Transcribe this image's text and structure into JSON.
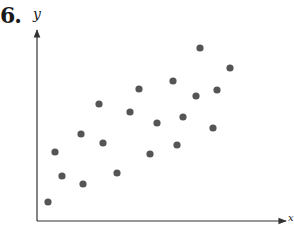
{
  "problem": {
    "number": "6."
  },
  "axes": {
    "x_label": "x",
    "y_label": "y"
  },
  "colors": {
    "dot": "#555555",
    "axis": "#333333"
  },
  "chart_data": {
    "type": "scatter",
    "title": "",
    "xlabel": "x",
    "ylabel": "y",
    "grid": false,
    "tick_labels": false,
    "note": "Unlabeled scatter plot showing positive correlation; values are pixel-estimated positions normalized to 0-100 scale along each axis.",
    "points": [
      {
        "x": 4.4,
        "y": 10.1
      },
      {
        "x": 7.3,
        "y": 36.5
      },
      {
        "x": 10.1,
        "y": 23.8
      },
      {
        "x": 17.7,
        "y": 46.0
      },
      {
        "x": 18.5,
        "y": 19.6
      },
      {
        "x": 25.0,
        "y": 61.9
      },
      {
        "x": 26.6,
        "y": 41.3
      },
      {
        "x": 32.3,
        "y": 25.4
      },
      {
        "x": 37.5,
        "y": 57.1
      },
      {
        "x": 41.1,
        "y": 69.8
      },
      {
        "x": 45.6,
        "y": 34.9
      },
      {
        "x": 48.4,
        "y": 51.3
      },
      {
        "x": 54.8,
        "y": 74.1
      },
      {
        "x": 56.5,
        "y": 40.2
      },
      {
        "x": 58.9,
        "y": 54.5
      },
      {
        "x": 64.1,
        "y": 66.1
      },
      {
        "x": 65.7,
        "y": 91.5
      },
      {
        "x": 71.0,
        "y": 49.2
      },
      {
        "x": 72.6,
        "y": 69.3
      },
      {
        "x": 77.8,
        "y": 80.4
      }
    ],
    "pixel_points": [
      [
        48,
        202
      ],
      [
        55,
        152
      ],
      [
        62,
        176
      ],
      [
        81,
        134
      ],
      [
        83,
        184
      ],
      [
        99,
        104
      ],
      [
        103,
        143
      ],
      [
        117,
        173
      ],
      [
        130,
        112
      ],
      [
        139,
        89
      ],
      [
        150,
        154
      ],
      [
        157,
        123
      ],
      [
        173,
        81
      ],
      [
        177,
        145
      ],
      [
        183,
        117
      ],
      [
        196,
        96
      ],
      [
        200,
        48
      ],
      [
        213,
        128
      ],
      [
        217,
        90
      ],
      [
        230,
        68
      ]
    ],
    "xlim": [
      0,
      100
    ],
    "ylim": [
      0,
      100
    ]
  }
}
